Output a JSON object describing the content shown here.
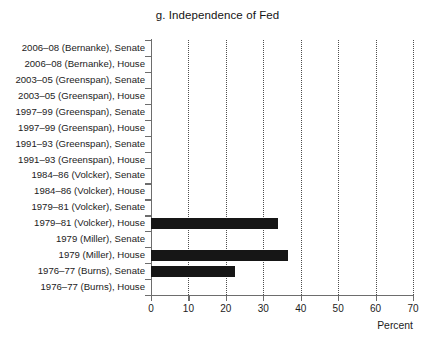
{
  "chart_data": {
    "type": "bar",
    "orientation": "horizontal",
    "title": "g. Independence of Fed",
    "xlabel": "Percent",
    "ylabel": "",
    "xlim": [
      0,
      70
    ],
    "xticks": [
      0,
      10,
      20,
      30,
      40,
      50,
      60,
      70
    ],
    "xtick_labels": [
      "0",
      "10",
      "20",
      "30",
      "40",
      "50",
      "60",
      "70"
    ],
    "grid": "vertical-dotted",
    "legend": "none",
    "bar_color": "#161616",
    "categories": [
      "2006–08 (Bernanke), Senate",
      "2006–08 (Bernanke), House",
      "2003–05 (Greenspan), Senate",
      "2003–05 (Greenspan), House",
      "1997–99 (Greenspan), Senate",
      "1997–99 (Greenspan), House",
      "1991–93 (Greenspan), Senate",
      "1991–93 (Greenspan), House",
      "1984–86 (Volcker), Senate",
      "1984–86 (Volcker), House",
      "1979–81 (Volcker), Senate",
      "1979–81 (Volcker), House",
      "1979 (Miller), Senate",
      "1979 (Miller), House",
      "1976–77 (Burns), Senate",
      "1976–77 (Burns), House"
    ],
    "values": [
      0,
      0,
      0,
      0,
      0,
      0,
      0,
      0,
      0,
      0,
      0,
      34,
      0,
      36.5,
      22.5,
      0
    ]
  }
}
